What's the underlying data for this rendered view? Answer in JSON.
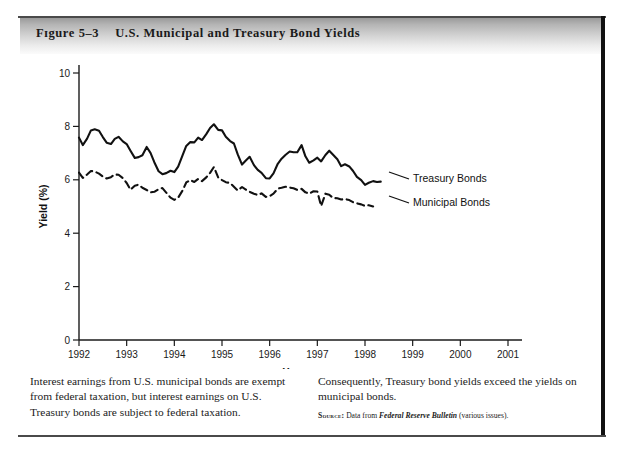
{
  "figure": {
    "number": "Figure 5-3",
    "number_display": "Fɪgure 5–3",
    "title": "U.S. Municipal and Treasury Bond Yields"
  },
  "caption": {
    "left": "Interest earnings from U.S. municipal bonds are exempt from federal taxation, but interest earnings on U.S. Treasury bonds are subject to federal taxation.",
    "right": "Consequently, Treasury bond yields exceed the yields on municipal bonds.",
    "source_label": "Source:",
    "source_text_before": "Data from",
    "source_italic": "Federal Reserve Bulletin",
    "source_text_after": "(various issues)."
  },
  "chart_data": {
    "type": "line",
    "title": "U.S. Municipal and Treasury Bond Yields",
    "xlabel": "Year",
    "ylabel": "Yield (%)",
    "xlim": [
      1992,
      2001
    ],
    "ylim": [
      0,
      10
    ],
    "xticks": [
      1992,
      1993,
      1994,
      1995,
      1996,
      1997,
      1998,
      1999,
      2000,
      2001
    ],
    "xticklabels": [
      "1992",
      "1993",
      "1994",
      "1995",
      "1996",
      "1997",
      "1998",
      "1999",
      "2000",
      "2001"
    ],
    "yticks": [
      0,
      2,
      4,
      6,
      8,
      10
    ],
    "yticklabels": [
      "0",
      "2",
      "4",
      "6",
      "8",
      "10"
    ],
    "grid": false,
    "legend_position": "inline-right",
    "series": [
      {
        "name": "Treasury Bonds",
        "style": "solid",
        "color": "#111111",
        "x": [
          1992.0,
          1992.08,
          1992.17,
          1992.25,
          1992.33,
          1992.42,
          1992.5,
          1992.58,
          1992.67,
          1992.75,
          1992.83,
          1992.92,
          1993.0,
          1993.08,
          1993.17,
          1993.25,
          1993.33,
          1993.42,
          1993.5,
          1993.58,
          1993.67,
          1993.75,
          1993.83,
          1993.92,
          1994.0,
          1994.08,
          1994.17,
          1994.25,
          1994.33,
          1994.42,
          1994.5,
          1994.58,
          1994.67,
          1994.75,
          1994.83,
          1994.92,
          1995.0,
          1995.08,
          1995.17,
          1995.25,
          1995.33,
          1995.42,
          1995.5,
          1995.58,
          1995.67,
          1995.75,
          1995.83,
          1995.92,
          1996.0,
          1996.08,
          1996.17,
          1996.25,
          1996.33,
          1996.42,
          1996.5,
          1996.58,
          1996.67,
          1996.75,
          1996.83,
          1996.92,
          1997.0,
          1997.08,
          1997.17,
          1997.25,
          1997.33,
          1997.42,
          1997.5,
          1997.58,
          1997.67,
          1997.75,
          1997.83,
          1997.92,
          1998.0,
          1998.08,
          1998.17,
          1998.25,
          1998.33
        ],
        "y": [
          7.58,
          7.3,
          7.54,
          7.85,
          7.89,
          7.84,
          7.6,
          7.39,
          7.34,
          7.53,
          7.61,
          7.44,
          7.34,
          7.09,
          6.82,
          6.85,
          6.92,
          7.23,
          7.01,
          6.66,
          6.32,
          6.21,
          6.25,
          6.34,
          6.29,
          6.49,
          6.91,
          7.27,
          7.41,
          7.4,
          7.58,
          7.49,
          7.71,
          7.94,
          8.08,
          7.87,
          7.85,
          7.61,
          7.45,
          7.36,
          6.95,
          6.57,
          6.72,
          6.86,
          6.55,
          6.37,
          6.26,
          6.06,
          6.05,
          6.24,
          6.6,
          6.79,
          6.93,
          7.06,
          7.03,
          7.03,
          7.3,
          6.88,
          6.64,
          6.73,
          6.83,
          6.69,
          6.93,
          7.09,
          6.94,
          6.77,
          6.51,
          6.58,
          6.5,
          6.33,
          6.11,
          5.99,
          5.81,
          5.89,
          5.95,
          5.92,
          5.93
        ]
      },
      {
        "name": "Municipal Bonds",
        "style": "dashed",
        "color": "#111111",
        "x": [
          1992.0,
          1992.08,
          1992.17,
          1992.25,
          1992.33,
          1992.42,
          1992.5,
          1992.58,
          1992.67,
          1992.75,
          1992.83,
          1992.92,
          1993.0,
          1993.08,
          1993.17,
          1993.25,
          1993.33,
          1993.42,
          1993.5,
          1993.58,
          1993.67,
          1993.75,
          1993.83,
          1993.92,
          1994.0,
          1994.08,
          1994.17,
          1994.25,
          1994.33,
          1994.42,
          1994.5,
          1994.58,
          1994.67,
          1994.75,
          1994.83,
          1994.92,
          1995.0,
          1995.08,
          1995.17,
          1995.25,
          1995.33,
          1995.42,
          1995.5,
          1995.58,
          1995.67,
          1995.75,
          1995.83,
          1995.92,
          1996.0,
          1996.08,
          1996.17,
          1996.25,
          1996.33,
          1996.42,
          1996.5,
          1996.58,
          1996.67,
          1996.75,
          1996.83,
          1996.92,
          1997.0,
          1997.08,
          1997.17,
          1997.25,
          1997.33,
          1997.42,
          1997.5,
          1997.58,
          1997.67,
          1997.75,
          1997.83,
          1997.92,
          1998.0,
          1998.08,
          1998.17
        ],
        "y": [
          6.27,
          6.07,
          6.2,
          6.33,
          6.31,
          6.23,
          6.12,
          6.05,
          6.1,
          6.2,
          6.19,
          6.06,
          5.88,
          5.63,
          5.78,
          5.82,
          5.7,
          5.62,
          5.53,
          5.55,
          5.65,
          5.69,
          5.52,
          5.33,
          5.25,
          5.33,
          5.59,
          5.9,
          5.99,
          5.92,
          6.03,
          5.95,
          6.09,
          6.26,
          6.48,
          6.09,
          5.99,
          5.91,
          5.88,
          5.74,
          5.6,
          5.73,
          5.63,
          5.55,
          5.48,
          5.43,
          5.49,
          5.36,
          5.39,
          5.48,
          5.67,
          5.7,
          5.74,
          5.71,
          5.68,
          5.62,
          5.66,
          5.53,
          5.48,
          5.57,
          5.56,
          5.02,
          5.48,
          5.44,
          5.32,
          5.31,
          5.26,
          5.28,
          5.24,
          5.16,
          5.12,
          5.08,
          5.02,
          5.05,
          5.0
        ]
      }
    ],
    "annotations": [
      {
        "text": "Treasury Bonds",
        "series": "Treasury Bonds"
      },
      {
        "text": "Municipal Bonds",
        "series": "Municipal Bonds"
      }
    ]
  }
}
